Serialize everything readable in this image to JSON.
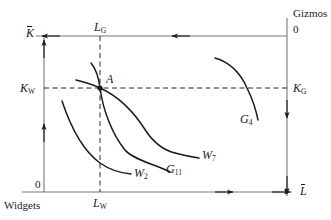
{
  "figure": {
    "type": "edgeworth-box",
    "stroke_color": "#1a1a1a",
    "text_color": "#1a1a1a",
    "background": "#ffffff"
  },
  "origins": {
    "widgets": {
      "corner_label": "Widgets",
      "zero_label": "0"
    },
    "gizmos": {
      "corner_label": "Gizmos",
      "zero_label": "0"
    }
  },
  "axes": {
    "widgets_capital": {
      "letter": "K",
      "overbar": true
    },
    "widgets_labor": {
      "letter": "L",
      "overbar": true
    },
    "gizmos_capital": {
      "letter": "K",
      "overbar": true
    },
    "gizmos_labor": {
      "letter": "L",
      "overbar": true
    }
  },
  "allocation_labels": {
    "labor_gizmos": {
      "letter": "L",
      "sub": "G"
    },
    "labor_widgets": {
      "letter": "L",
      "sub": "W"
    },
    "capital_widgets": {
      "letter": "K",
      "sub": "W"
    },
    "capital_gizmos": {
      "letter": "K",
      "sub": "G"
    }
  },
  "point": {
    "name": "A",
    "label": "A"
  },
  "curves": [
    {
      "id": "W2",
      "letter": "W",
      "sub": "2",
      "kind": "widget-isoquant"
    },
    {
      "id": "W7",
      "letter": "W",
      "sub": "7",
      "kind": "widget-isoquant"
    },
    {
      "id": "G11",
      "letter": "G",
      "sub": "11",
      "kind": "gizmo-isoquant"
    },
    {
      "id": "G4",
      "letter": "G",
      "sub": "4",
      "kind": "gizmo-isoquant"
    }
  ]
}
